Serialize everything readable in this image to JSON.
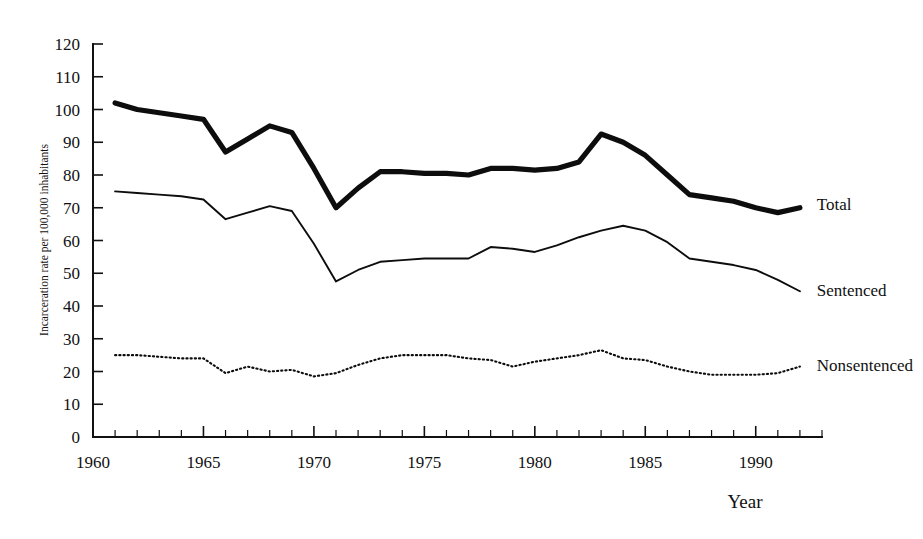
{
  "chart_data": {
    "type": "line",
    "title": "",
    "subtitle": "",
    "xlabel": "Year",
    "ylabel": "Incarceration rate per 100,000 inhabitants",
    "xlim": [
      1960,
      1993
    ],
    "ylim": [
      0,
      120
    ],
    "grid": false,
    "legend_position": "right-inline",
    "x_tick_labels": [
      "1960",
      "1965",
      "1970",
      "1975",
      "1980",
      "1985",
      "1990"
    ],
    "x_tick_values": [
      1960,
      1965,
      1970,
      1975,
      1980,
      1985,
      1990
    ],
    "x_minor_tick_step": 1,
    "y_tick_labels": [
      "0",
      "10",
      "20",
      "30",
      "40",
      "50",
      "60",
      "70",
      "80",
      "90",
      "100",
      "110",
      "120"
    ],
    "y_tick_values": [
      0,
      10,
      20,
      30,
      40,
      50,
      60,
      70,
      80,
      90,
      100,
      110,
      120
    ],
    "x": [
      1961,
      1962,
      1963,
      1964,
      1965,
      1966,
      1967,
      1968,
      1969,
      1970,
      1971,
      1972,
      1973,
      1974,
      1975,
      1976,
      1977,
      1978,
      1979,
      1980,
      1981,
      1982,
      1983,
      1984,
      1985,
      1986,
      1987,
      1988,
      1989,
      1990,
      1991,
      1992
    ],
    "series": [
      {
        "name": "Total",
        "style": "thick-solid",
        "color": "#0d0d0d",
        "values": [
          102,
          100,
          99,
          98,
          97,
          87,
          91,
          95,
          93,
          82,
          70,
          76,
          81,
          81,
          80.5,
          80.5,
          80,
          82,
          82,
          81.5,
          82,
          84,
          92.5,
          90,
          86,
          80,
          74,
          73,
          72,
          70,
          68.5,
          70
        ]
      },
      {
        "name": "Sentenced",
        "style": "thin-solid",
        "color": "#0d0d0d",
        "values": [
          75,
          74.5,
          74,
          73.5,
          72.5,
          66.5,
          68.5,
          70.5,
          69,
          59,
          47.5,
          51,
          53.5,
          54,
          54.5,
          54.5,
          54.5,
          58,
          57.5,
          56.5,
          58.5,
          61,
          63,
          64.5,
          63,
          59.5,
          54.5,
          53.5,
          52.5,
          51,
          48,
          44.5
        ]
      },
      {
        "name": "Nonsentenced",
        "style": "dotted",
        "color": "#0d0d0d",
        "values": [
          25,
          25,
          24.5,
          24,
          24,
          19.5,
          21.5,
          20,
          20.5,
          18.5,
          19.5,
          22,
          24,
          25,
          25,
          25,
          24,
          23.5,
          21.5,
          23,
          24,
          25,
          26.5,
          24,
          23.5,
          21.5,
          20,
          19,
          19,
          19,
          19.5,
          21.5
        ]
      }
    ],
    "annotations": [
      {
        "text": "Total",
        "x": 1992.4,
        "y": 71
      },
      {
        "text": "Sentenced",
        "x": 1992.4,
        "y": 45
      },
      {
        "text": "Nonsentenced",
        "x": 1992.4,
        "y": 22
      }
    ]
  }
}
